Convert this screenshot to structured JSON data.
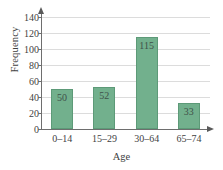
{
  "chart_data": {
    "type": "bar",
    "title": "",
    "xlabel": "Age",
    "ylabel": "Frequency",
    "categories": [
      "0–14",
      "15–29",
      "30–64",
      "65–74"
    ],
    "values": [
      50,
      52,
      115,
      33
    ],
    "value_labels": [
      "50",
      "52",
      "115",
      "33"
    ],
    "ylim": [
      0,
      140
    ],
    "yticks": [
      0,
      20,
      40,
      60,
      80,
      100,
      120,
      140
    ],
    "ytick_labels": [
      "0",
      "20",
      "40",
      "60",
      "80",
      "100",
      "120",
      "140"
    ],
    "grid": true,
    "legend": false,
    "bar_color": "#72b08d",
    "bar_edge_color": "#5d9a78",
    "grid_color": "#dcdcdc",
    "axis_color": "#6e6e6e",
    "background": "#ffffff"
  }
}
